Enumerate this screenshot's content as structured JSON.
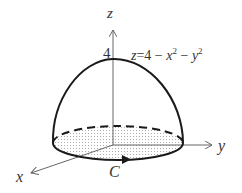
{
  "diagram": {
    "type": "3d-surface-sketch",
    "surface_equation": {
      "lhs": "z",
      "eq": "=",
      "rhs_const": "4",
      "minus": "−",
      "x": "x",
      "y": "y",
      "exp": "2"
    },
    "axes": {
      "x_label": "x",
      "y_label": "y",
      "z_label": "z"
    },
    "z_intercept_label": "4",
    "curve_label": "C",
    "colors": {
      "stroke": "#1a1a1a",
      "axis": "#666666",
      "dots": "#555555",
      "background": "#ffffff"
    }
  }
}
